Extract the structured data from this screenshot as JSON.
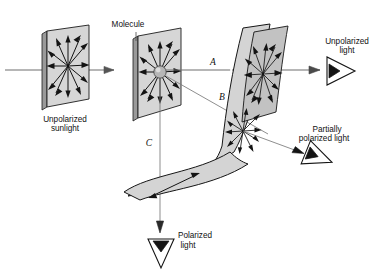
{
  "figure": {
    "title_visible": false,
    "background_color": "#ffffff"
  },
  "labels": {
    "molecule": "Molecule",
    "unpolarized_sunlight_line1": "Unpolarized",
    "unpolarized_sunlight_line2": "sunlight",
    "unpolarized_light_line1": "Unpolarized",
    "unpolarized_light_line2": "light",
    "partially_polarized_line1": "Partially",
    "partially_polarized_line2": "polarized light",
    "polarized_light_line1": "Polarized",
    "polarized_light_line2": "light",
    "ray_a": "A",
    "ray_b": "B",
    "ray_c": "C"
  },
  "colors": {
    "plane_fill": "#d6d6d6",
    "plane_edge": "#9a9a9a",
    "outline": "#1c1c1c",
    "ray": "#6e6e6e",
    "vector": "#131313",
    "eye_fill": "#ffffff",
    "molecule_fill": "#b6b6b6",
    "text": "#111111"
  },
  "elements": {
    "planes": [
      {
        "name": "incident-unpolarized-plane",
        "label": "Unpolarized sunlight",
        "vector_count": 12
      },
      {
        "name": "molecule-plane",
        "label": "Molecule",
        "vector_count": 12
      },
      {
        "name": "forward-scatter-plane",
        "label": "Unpolarized light",
        "vector_count": 12
      },
      {
        "name": "side-scatter-plane",
        "label": "Partially polarized light",
        "vector_count": 10
      },
      {
        "name": "down-scatter-plane",
        "label": "Polarized light",
        "vector_count": 1
      }
    ],
    "rays": [
      {
        "name": "ray-a-forward",
        "label": "A",
        "direction": "horizontal-right",
        "result": "Unpolarized light"
      },
      {
        "name": "ray-b-oblique",
        "label": "B",
        "direction": "down-right",
        "result": "Partially polarized light"
      },
      {
        "name": "ray-c-downward",
        "label": "C",
        "direction": "down",
        "result": "Polarized light"
      }
    ],
    "observers": [
      {
        "name": "eye-unpolarized",
        "orientation": "right"
      },
      {
        "name": "eye-partially-polarized",
        "orientation": "down-right"
      },
      {
        "name": "eye-polarized",
        "orientation": "down"
      }
    ]
  }
}
